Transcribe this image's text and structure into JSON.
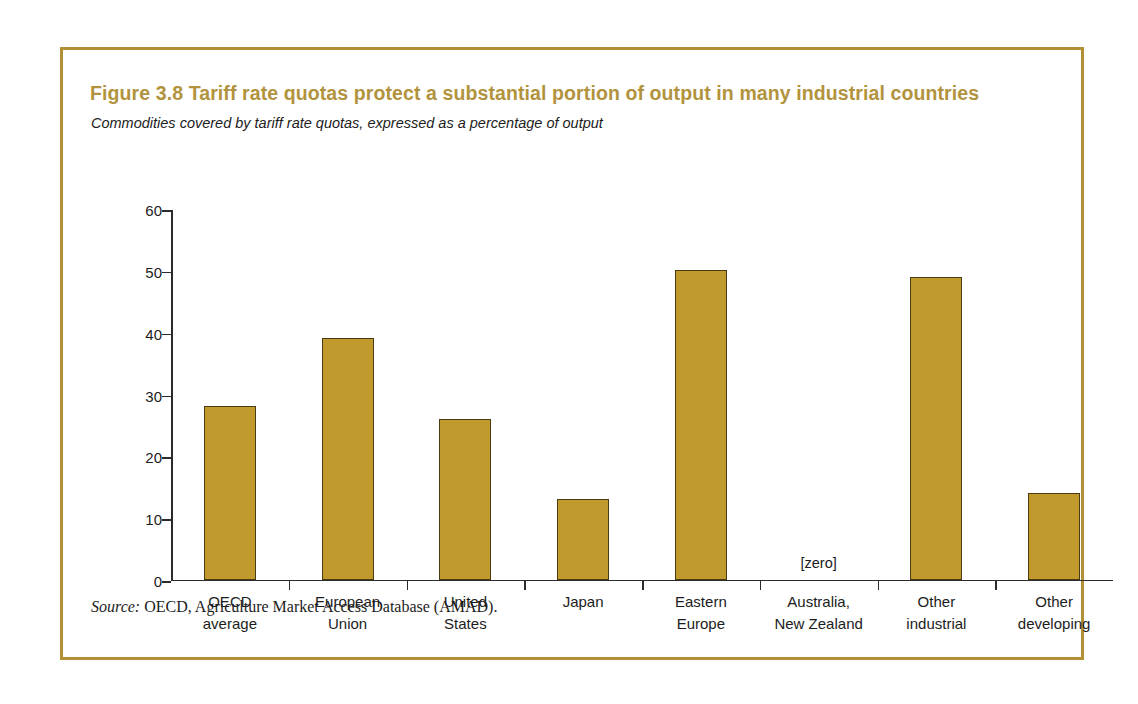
{
  "figure": {
    "title": "Figure 3.8  Tariff rate quotas protect a substantial portion of output in many industrial countries",
    "subtitle": "Commodities covered by tariff rate quotas, expressed as a percentage of output",
    "source_label": "Source:",
    "source_text": " OECD, Agriculture Market Access Database (AMAD).",
    "frame_color": "#b08f35",
    "title_color": "#b2933d"
  },
  "chart_data": {
    "type": "bar",
    "title": "Figure 3.8  Tariff rate quotas protect a substantial portion of output in many industrial countries",
    "subtitle": "Commodities covered by tariff rate quotas, expressed as a percentage of output",
    "xlabel": "",
    "ylabel": "",
    "ylim": [
      0,
      60
    ],
    "yticks": [
      0,
      10,
      20,
      30,
      40,
      50,
      60
    ],
    "ytick_labels": [
      "0",
      "10",
      "20",
      "30",
      "40",
      "50",
      "60"
    ],
    "grid": false,
    "legend": "none",
    "bar_color": "#c09a2c",
    "bar_edge_color": "#4a3c12",
    "categories": [
      "OECD average",
      "European Union",
      "United States",
      "Japan",
      "Eastern Europe",
      "Australia, New Zealand",
      "Other industrial",
      "Other developing"
    ],
    "category_lines": [
      [
        "OECD",
        "average"
      ],
      [
        "European",
        "Union"
      ],
      [
        "United",
        "States"
      ],
      [
        "Japan",
        ""
      ],
      [
        "Eastern",
        "Europe"
      ],
      [
        "Australia,",
        "New Zealand"
      ],
      [
        "Other",
        "industrial"
      ],
      [
        "Other",
        "developing"
      ]
    ],
    "values": [
      28,
      39,
      26,
      13,
      50,
      0,
      49,
      14
    ],
    "annotations": [
      {
        "category": "Australia, New Zealand",
        "text": "[zero]"
      }
    ]
  }
}
